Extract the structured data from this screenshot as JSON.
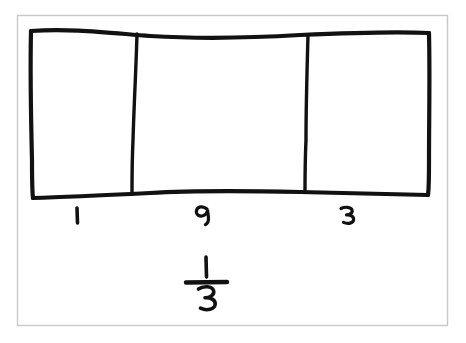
{
  "figure": {
    "background_color": "#ffffff",
    "ink_color": "#111111",
    "frame_color": "#c8c8c8"
  },
  "bar": {
    "name": "fraction-bar-model",
    "total_parts": 3,
    "shaded_parts": 0,
    "part_labels": [
      "1",
      "2",
      "3"
    ]
  },
  "labels": {
    "part_1": "1",
    "part_2": "2",
    "part_3": "3"
  },
  "fraction": {
    "numerator": "1",
    "denominator": "3",
    "reading": "1/3"
  }
}
